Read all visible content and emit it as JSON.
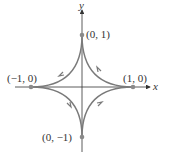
{
  "diagram": {
    "axes": {
      "x_label": "x",
      "y_label": "y"
    },
    "points": [
      {
        "label": "(0, 1)",
        "x": 0,
        "y": 1
      },
      {
        "label": "(−1, 0)",
        "x": -1,
        "y": 0
      },
      {
        "label": "(1, 0)",
        "x": 1,
        "y": 0
      },
      {
        "label": "(0, −1)",
        "x": 0,
        "y": -1
      }
    ],
    "orientation": "counterclockwise",
    "curve_color": "#7a7a7a",
    "point_color": "#8a8a8a"
  }
}
